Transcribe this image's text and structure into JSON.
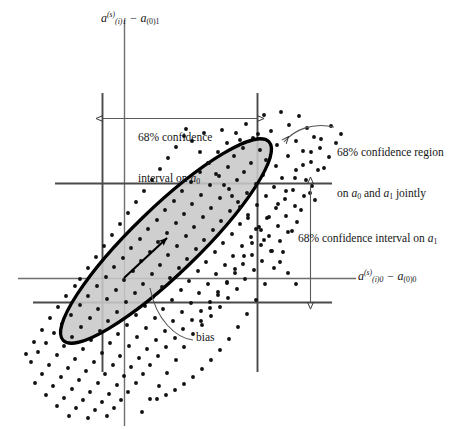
{
  "figure": {
    "kind": "scatter-with-confidence-ellipse",
    "background_color": "#ffffff",
    "ellipse_fill_color": "#c8c8c8",
    "ellipse_stroke_color": "#000000",
    "line_color": "#444444",
    "point_color": "#111111"
  },
  "axes": {
    "y_axis_label_html": "<i>a</i><span class=\"sup\">(s)</span><span class=\"sub\">(<i>i</i>)1</span> &minus; <i>a</i><span class=\"subn\">(0)1</span>",
    "x_axis_label_html": "<i>a</i><span class=\"sup\">(s)</span><span class=\"sub\">(<i>i</i>)0</span> &minus; <i>a</i><span class=\"subn\">(0)0</span>",
    "y_axis_label_text": "a(s)(i)1 − a(0)1",
    "x_axis_label_text": "a(s)(i)0 − a(0)0"
  },
  "annotations": {
    "ci_a0_line1": "68% confidence",
    "ci_a0_line2_html": "interval on <i>a</i><span class=\"subn\">0</span>",
    "ci_a0_text": "68% confidence interval on a0",
    "region_line1": "68% confidence region",
    "region_line2_html": "on <i>a</i><span class=\"subn\">0</span> and <i>a</i><span class=\"subn\">1</span> jointly",
    "region_text": "68% confidence region on a0 and a1 jointly",
    "ci_a1_html": "68% confidence interval on <i>a</i><span class=\"subn\">1</span>",
    "ci_a1_text": "68% confidence interval on a1",
    "bias": "bias"
  },
  "chart_data": {
    "type": "scatter",
    "title": "",
    "xlabel": "a(s)(i)0 - a(0)0",
    "ylabel": "a(s)(i)1 - a(0)1",
    "grid": false,
    "legend": "none",
    "origin_px": {
      "x": 124,
      "y": 278
    },
    "xlim_px": [
      18,
      465
    ],
    "ylim_px": [
      18,
      425
    ],
    "confidence_lines": {
      "vertical_left_x": 102,
      "vertical_right_x": 257,
      "horizontal_top_y": 183,
      "horizontal_bottom_y": 302
    },
    "ellipse": {
      "center_px": {
        "x": 166,
        "y": 241
      },
      "semi_major_px": 143,
      "semi_minor_px": 33,
      "angle_deg": -44,
      "fill": "#c8c8c8",
      "stroke_width_px": 3.2
    },
    "bias_vector_px": {
      "x0": 124,
      "y0": 278,
      "x1": 168,
      "y1": 237
    },
    "points_px": [
      [
        264,
        115
      ],
      [
        281,
        112
      ],
      [
        299,
        116
      ],
      [
        246,
        124
      ],
      [
        289,
        125
      ],
      [
        307,
        128
      ],
      [
        271,
        131
      ],
      [
        236,
        133
      ],
      [
        253,
        138
      ],
      [
        314,
        137
      ],
      [
        296,
        141
      ],
      [
        277,
        145
      ],
      [
        227,
        143
      ],
      [
        243,
        148
      ],
      [
        260,
        150
      ],
      [
        303,
        151
      ],
      [
        320,
        148
      ],
      [
        288,
        156
      ],
      [
        266,
        160
      ],
      [
        234,
        156
      ],
      [
        218,
        152
      ],
      [
        251,
        163
      ],
      [
        276,
        166
      ],
      [
        311,
        162
      ],
      [
        296,
        170
      ],
      [
        209,
        163
      ],
      [
        228,
        167
      ],
      [
        244,
        172
      ],
      [
        263,
        175
      ],
      [
        282,
        178
      ],
      [
        324,
        168
      ],
      [
        306,
        180
      ],
      [
        200,
        172
      ],
      [
        219,
        176
      ],
      [
        237,
        180
      ],
      [
        256,
        184
      ],
      [
        274,
        187
      ],
      [
        293,
        190
      ],
      [
        312,
        186
      ],
      [
        191,
        182
      ],
      [
        210,
        185
      ],
      [
        229,
        189
      ],
      [
        247,
        193
      ],
      [
        266,
        196
      ],
      [
        285,
        199
      ],
      [
        304,
        196
      ],
      [
        182,
        191
      ],
      [
        201,
        195
      ],
      [
        220,
        198
      ],
      [
        238,
        202
      ],
      [
        257,
        205
      ],
      [
        276,
        208
      ],
      [
        295,
        206
      ],
      [
        315,
        200
      ],
      [
        174,
        201
      ],
      [
        192,
        204
      ],
      [
        211,
        208
      ],
      [
        230,
        211
      ],
      [
        248,
        215
      ],
      [
        267,
        218
      ],
      [
        286,
        216
      ],
      [
        165,
        210
      ],
      [
        184,
        214
      ],
      [
        203,
        217
      ],
      [
        221,
        221
      ],
      [
        240,
        224
      ],
      [
        259,
        227
      ],
      [
        278,
        226
      ],
      [
        297,
        222
      ],
      [
        157,
        220
      ],
      [
        176,
        223
      ],
      [
        194,
        227
      ],
      [
        213,
        230
      ],
      [
        232,
        234
      ],
      [
        251,
        237
      ],
      [
        269,
        236
      ],
      [
        288,
        232
      ],
      [
        148,
        229
      ],
      [
        167,
        233
      ],
      [
        186,
        236
      ],
      [
        204,
        240
      ],
      [
        223,
        243
      ],
      [
        242,
        246
      ],
      [
        261,
        245
      ],
      [
        280,
        241
      ],
      [
        140,
        239
      ],
      [
        158,
        242
      ],
      [
        177,
        246
      ],
      [
        196,
        249
      ],
      [
        215,
        252
      ],
      [
        233,
        256
      ],
      [
        252,
        255
      ],
      [
        271,
        251
      ],
      [
        131,
        248
      ],
      [
        150,
        252
      ],
      [
        168,
        255
      ],
      [
        187,
        259
      ],
      [
        206,
        262
      ],
      [
        225,
        265
      ],
      [
        243,
        264
      ],
      [
        262,
        261
      ],
      [
        123,
        258
      ],
      [
        141,
        261
      ],
      [
        160,
        265
      ],
      [
        179,
        268
      ],
      [
        198,
        271
      ],
      [
        216,
        274
      ],
      [
        235,
        273
      ],
      [
        254,
        270
      ],
      [
        114,
        267
      ],
      [
        133,
        271
      ],
      [
        152,
        274
      ],
      [
        170,
        278
      ],
      [
        189,
        281
      ],
      [
        208,
        284
      ],
      [
        227,
        283
      ],
      [
        245,
        279
      ],
      [
        106,
        277
      ],
      [
        124,
        280
      ],
      [
        143,
        284
      ],
      [
        162,
        287
      ],
      [
        181,
        290
      ],
      [
        199,
        293
      ],
      [
        218,
        292
      ],
      [
        237,
        289
      ],
      [
        97,
        286
      ],
      [
        116,
        290
      ],
      [
        135,
        293
      ],
      [
        153,
        297
      ],
      [
        172,
        300
      ],
      [
        191,
        303
      ],
      [
        210,
        302
      ],
      [
        228,
        298
      ],
      [
        88,
        296
      ],
      [
        107,
        299
      ],
      [
        126,
        302
      ],
      [
        145,
        306
      ],
      [
        163,
        309
      ],
      [
        182,
        312
      ],
      [
        201,
        311
      ],
      [
        220,
        307
      ],
      [
        80,
        305
      ],
      [
        98,
        309
      ],
      [
        117,
        312
      ],
      [
        136,
        315
      ],
      [
        155,
        318
      ],
      [
        173,
        321
      ],
      [
        192,
        320
      ],
      [
        211,
        316
      ],
      [
        71,
        315
      ],
      [
        90,
        318
      ],
      [
        108,
        321
      ],
      [
        127,
        325
      ],
      [
        146,
        328
      ],
      [
        165,
        331
      ],
      [
        183,
        329
      ],
      [
        202,
        325
      ],
      [
        62,
        324
      ],
      [
        81,
        327
      ],
      [
        100,
        331
      ],
      [
        118,
        334
      ],
      [
        137,
        337
      ],
      [
        156,
        340
      ],
      [
        175,
        338
      ],
      [
        54,
        333
      ],
      [
        72,
        337
      ],
      [
        91,
        340
      ],
      [
        110,
        343
      ],
      [
        129,
        346
      ],
      [
        147,
        349
      ],
      [
        166,
        347
      ],
      [
        46,
        343
      ],
      [
        64,
        346
      ],
      [
        83,
        349
      ],
      [
        102,
        353
      ],
      [
        120,
        356
      ],
      [
        139,
        358
      ],
      [
        158,
        356
      ],
      [
        38,
        352
      ],
      [
        57,
        355
      ],
      [
        75,
        359
      ],
      [
        94,
        362
      ],
      [
        113,
        365
      ],
      [
        131,
        367
      ],
      [
        150,
        365
      ],
      [
        31,
        362
      ],
      [
        49,
        365
      ],
      [
        68,
        368
      ],
      [
        86,
        371
      ],
      [
        105,
        374
      ],
      [
        124,
        376
      ],
      [
        143,
        374
      ],
      [
        42,
        374
      ],
      [
        61,
        377
      ],
      [
        79,
        380
      ],
      [
        98,
        383
      ],
      [
        117,
        385
      ],
      [
        136,
        383
      ],
      [
        35,
        383
      ],
      [
        53,
        386
      ],
      [
        72,
        389
      ],
      [
        90,
        392
      ],
      [
        109,
        394
      ],
      [
        128,
        392
      ],
      [
        46,
        395
      ],
      [
        64,
        398
      ],
      [
        83,
        400
      ],
      [
        102,
        402
      ],
      [
        121,
        400
      ],
      [
        57,
        406
      ],
      [
        76,
        408
      ],
      [
        95,
        410
      ],
      [
        114,
        408
      ],
      [
        69,
        416
      ],
      [
        88,
        418
      ],
      [
        107,
        416
      ],
      [
        336,
        143
      ],
      [
        329,
        157
      ],
      [
        318,
        170
      ],
      [
        310,
        193
      ],
      [
        301,
        210
      ],
      [
        292,
        231
      ],
      [
        283,
        252
      ],
      [
        274,
        268
      ],
      [
        265,
        284
      ],
      [
        256,
        300
      ],
      [
        247,
        314
      ],
      [
        238,
        327
      ],
      [
        229,
        339
      ],
      [
        220,
        350
      ],
      [
        211,
        360
      ],
      [
        202,
        369
      ],
      [
        193,
        377
      ],
      [
        184,
        384
      ],
      [
        175,
        390
      ],
      [
        166,
        395
      ],
      [
        157,
        399
      ],
      [
        331,
        126
      ],
      [
        321,
        139
      ],
      [
        311,
        152
      ],
      [
        341,
        134
      ],
      [
        303,
        165
      ],
      [
        295,
        178
      ],
      [
        286,
        191
      ],
      [
        278,
        204
      ],
      [
        269,
        217
      ],
      [
        261,
        230
      ],
      [
        252,
        243
      ],
      [
        244,
        256
      ],
      [
        235,
        269
      ],
      [
        227,
        282
      ],
      [
        218,
        295
      ],
      [
        210,
        308
      ],
      [
        201,
        321
      ],
      [
        193,
        334
      ],
      [
        184,
        347
      ],
      [
        176,
        360
      ],
      [
        167,
        373
      ],
      [
        159,
        386
      ],
      [
        150,
        399
      ],
      [
        142,
        412
      ],
      [
        75,
        286
      ],
      [
        66,
        296
      ],
      [
        58,
        307
      ],
      [
        50,
        318
      ],
      [
        42,
        330
      ],
      [
        34,
        342
      ],
      [
        26,
        354
      ],
      [
        88,
        268
      ],
      [
        80,
        279
      ],
      [
        96,
        257
      ],
      [
        104,
        246
      ],
      [
        112,
        235
      ],
      [
        120,
        224
      ],
      [
        128,
        213
      ],
      [
        136,
        202
      ],
      [
        144,
        191
      ],
      [
        152,
        180
      ],
      [
        160,
        169
      ],
      [
        168,
        158
      ],
      [
        176,
        147
      ],
      [
        184,
        136
      ],
      [
        192,
        141
      ],
      [
        200,
        152
      ],
      [
        208,
        163
      ],
      [
        216,
        174
      ],
      [
        224,
        185
      ],
      [
        232,
        196
      ],
      [
        240,
        207
      ],
      [
        248,
        218
      ],
      [
        256,
        229
      ],
      [
        264,
        240
      ],
      [
        272,
        251
      ],
      [
        280,
        262
      ],
      [
        288,
        273
      ],
      [
        296,
        284
      ],
      [
        186,
        129
      ],
      [
        204,
        133
      ],
      [
        222,
        130
      ],
      [
        258,
        134
      ],
      [
        240,
        140
      ]
    ]
  }
}
